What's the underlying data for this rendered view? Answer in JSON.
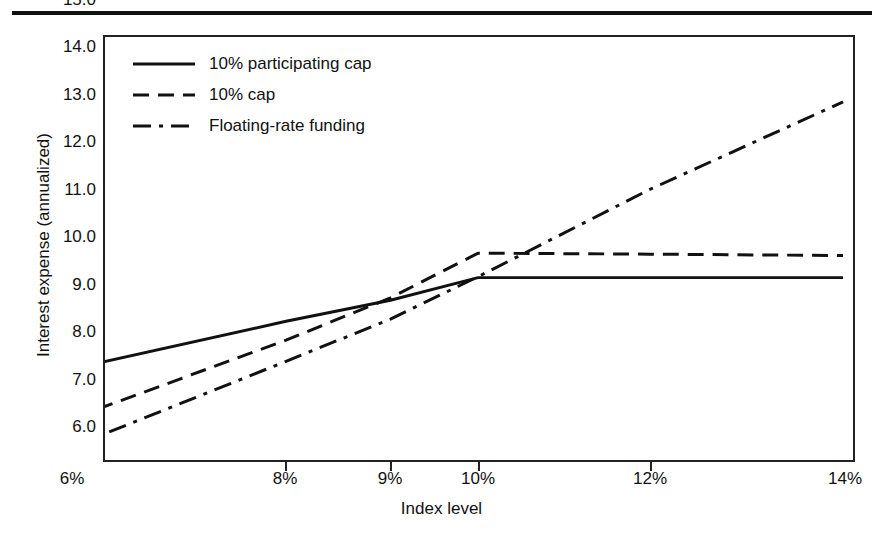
{
  "figure": {
    "title_fragment": "",
    "rule": "top-rule"
  },
  "chart_data": {
    "type": "line",
    "title": "",
    "xlabel": "Index level",
    "ylabel": "Interest expense (annualized)",
    "x_categories": [
      "6%",
      "8%",
      "9%",
      "10%",
      "12%",
      "14%"
    ],
    "x_tick_positions_px": [
      72,
      285,
      390,
      478,
      650,
      845
    ],
    "ylim": [
      6.0,
      15.0
    ],
    "y_ticks": [
      "6.0",
      "7.0",
      "8.0",
      "9.0",
      "10.0",
      "11.0",
      "12.0",
      "13.0",
      "14.0",
      "15.0"
    ],
    "grid": false,
    "legend_position": "upper left",
    "series": [
      {
        "name": "10% participating cap",
        "style": "solid",
        "color": "#111111",
        "x": [
          "6%",
          "8%",
          "9%",
          "10%",
          "12%",
          "14%"
        ],
        "values": [
          7.95,
          8.95,
          9.4,
          9.88,
          9.88,
          9.88
        ]
      },
      {
        "name": "10% cap",
        "style": "dashed",
        "color": "#111111",
        "x": [
          "6%",
          "8%",
          "9%",
          "10%",
          "12%",
          "14%"
        ],
        "values": [
          6.9,
          8.55,
          9.45,
          10.4,
          10.38,
          10.35
        ]
      },
      {
        "name": "Floating-rate funding",
        "style": "dashdot",
        "color": "#111111",
        "x": [
          "6%",
          "8%",
          "9%",
          "10%",
          "12%",
          "14%"
        ],
        "values": [
          6.3,
          8.1,
          9.0,
          9.9,
          11.75,
          13.62
        ]
      }
    ]
  },
  "legend": {
    "items": [
      {
        "label": "10% participating cap",
        "style": "solid"
      },
      {
        "label": "10% cap",
        "style": "dashed"
      },
      {
        "label": "Floating-rate funding",
        "style": "dashdot"
      }
    ]
  },
  "y_axis": {
    "ticks": [
      {
        "label": "15.0"
      },
      {
        "label": "14.0"
      },
      {
        "label": "13.0"
      },
      {
        "label": "12.0"
      },
      {
        "label": "11.0"
      },
      {
        "label": "10.0"
      },
      {
        "label": "9.0"
      },
      {
        "label": "8.0"
      },
      {
        "label": "7.0"
      },
      {
        "label": "6.0"
      }
    ]
  },
  "x_axis": {
    "ticks": [
      {
        "label": "6%"
      },
      {
        "label": "8%"
      },
      {
        "label": "9%"
      },
      {
        "label": "10%"
      },
      {
        "label": "12%"
      },
      {
        "label": "14%"
      }
    ]
  }
}
